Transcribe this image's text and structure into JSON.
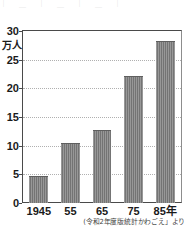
{
  "chart_data": {
    "type": "bar",
    "title": "",
    "xlabel": "",
    "ylabel": "万人",
    "categories": [
      "1945",
      "55",
      "65",
      "75",
      "85年"
    ],
    "values": [
      4.7,
      10.5,
      12.7,
      22.2,
      28.2
    ],
    "ylim": [
      0,
      30
    ],
    "y_ticks": [
      0,
      5,
      10,
      15,
      20,
      25,
      30
    ],
    "y_tick_labels": [
      "0",
      "5",
      "10",
      "15",
      "20",
      "25",
      "30"
    ],
    "y_unit_label": "万人",
    "grid": true,
    "grid_style": "dotted",
    "legend": null,
    "bar_color": "#7b7b7b",
    "source_note": "(令和2年度版統計かわごえ」より"
  },
  "figure": {
    "top_crop_text": "｜ ＿ ｜ ＿ ｜ ＿ ｜",
    "axis_color": "#4a4a4a",
    "grid_color": "#b0b0b0",
    "background": "#ffffff"
  }
}
